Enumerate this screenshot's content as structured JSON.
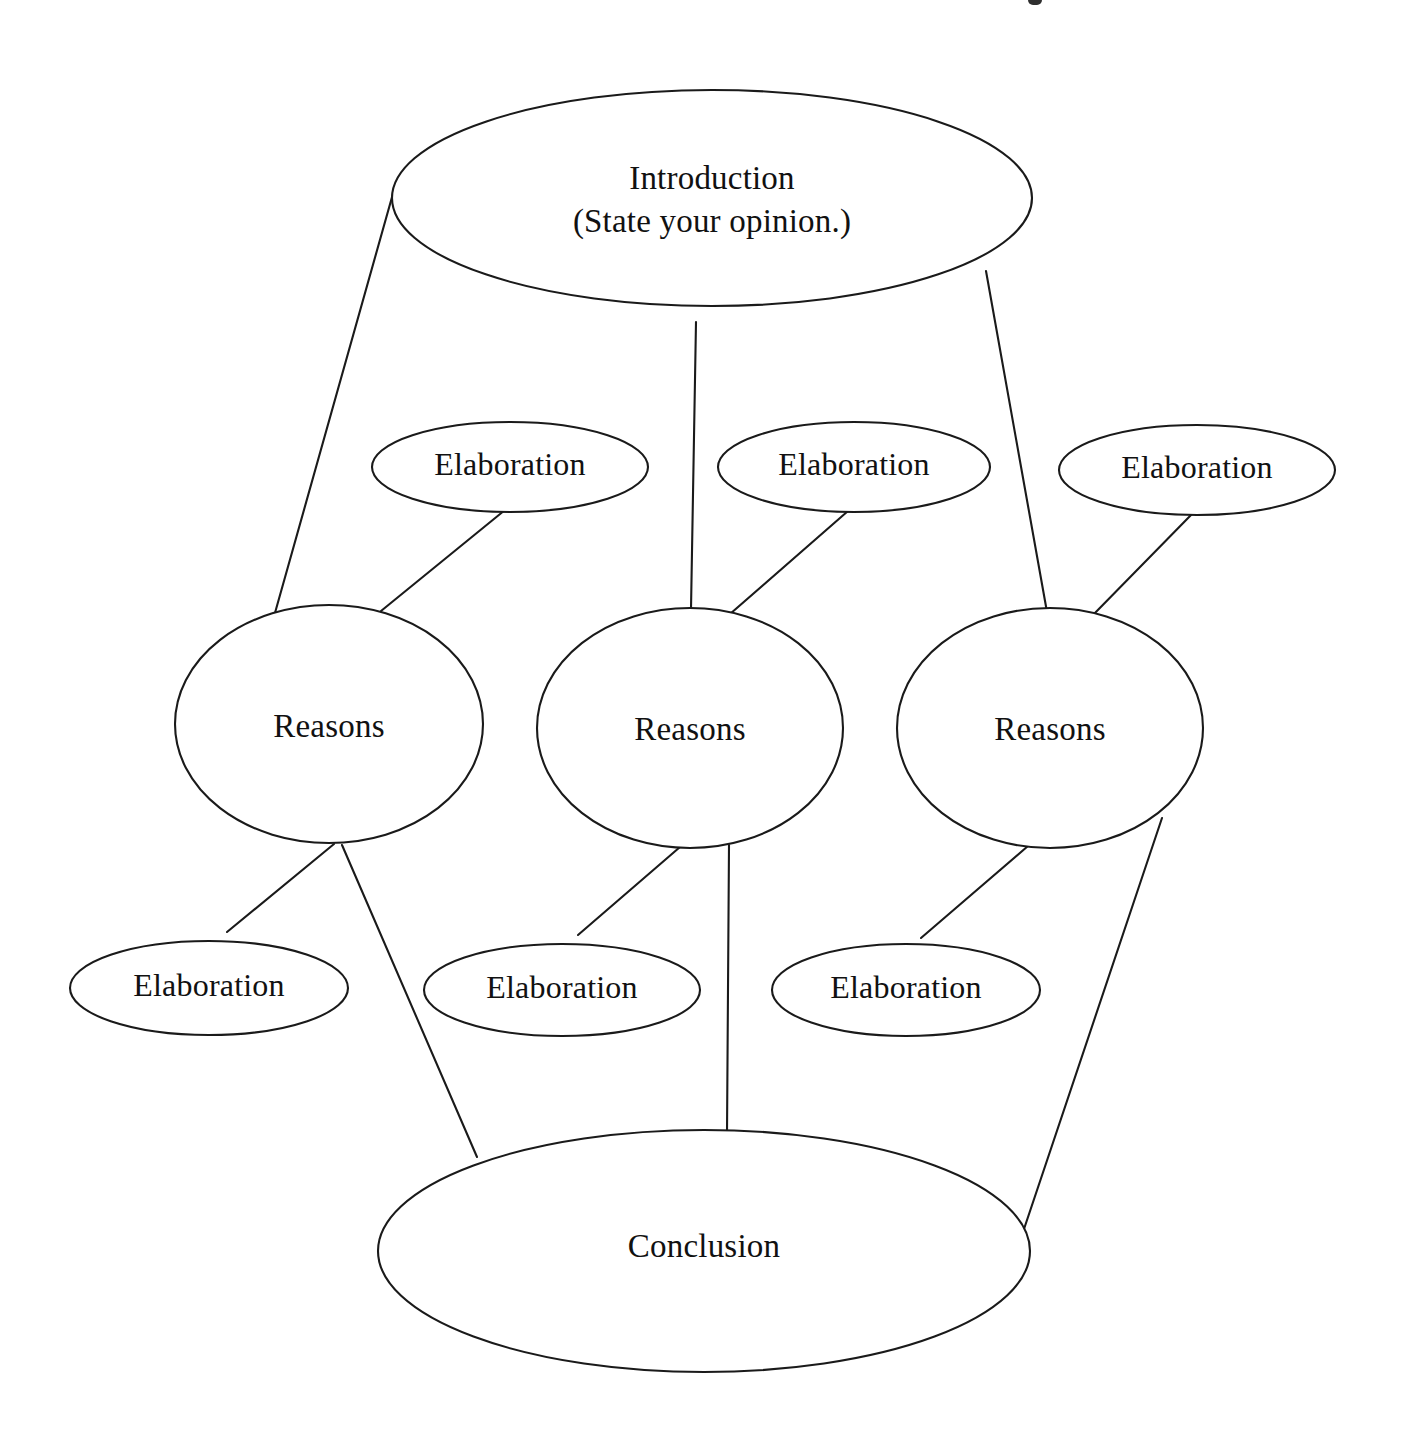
{
  "diagram": {
    "type": "opinion-essay-web",
    "background_color": "#ffffff",
    "line_color": "#1a1a1a",
    "text_color": "#111111",
    "nodes": {
      "introduction": {
        "label_line1": "Introduction",
        "label_line2": "(State your opinion.)",
        "shape": "ellipse"
      },
      "elaboration_top_1": {
        "label": "Elaboration",
        "shape": "ellipse"
      },
      "elaboration_top_2": {
        "label": "Elaboration",
        "shape": "ellipse"
      },
      "elaboration_top_3": {
        "label": "Elaboration",
        "shape": "ellipse"
      },
      "reasons_1": {
        "label": "Reasons",
        "shape": "ellipse"
      },
      "reasons_2": {
        "label": "Reasons",
        "shape": "ellipse"
      },
      "reasons_3": {
        "label": "Reasons",
        "shape": "ellipse"
      },
      "elaboration_bottom_1": {
        "label": "Elaboration",
        "shape": "ellipse"
      },
      "elaboration_bottom_2": {
        "label": "Elaboration",
        "shape": "ellipse"
      },
      "elaboration_bottom_3": {
        "label": "Elaboration",
        "shape": "ellipse"
      },
      "conclusion": {
        "label": "Conclusion",
        "shape": "ellipse"
      }
    },
    "edges": [
      {
        "from": "introduction",
        "to": "reasons_1"
      },
      {
        "from": "introduction",
        "to": "reasons_2"
      },
      {
        "from": "introduction",
        "to": "reasons_3"
      },
      {
        "from": "elaboration_top_1",
        "to": "reasons_1"
      },
      {
        "from": "elaboration_top_2",
        "to": "reasons_2"
      },
      {
        "from": "elaboration_top_3",
        "to": "reasons_3"
      },
      {
        "from": "reasons_1",
        "to": "elaboration_bottom_1"
      },
      {
        "from": "reasons_2",
        "to": "elaboration_bottom_2"
      },
      {
        "from": "reasons_3",
        "to": "elaboration_bottom_3"
      },
      {
        "from": "reasons_1",
        "to": "conclusion"
      },
      {
        "from": "reasons_2",
        "to": "conclusion"
      },
      {
        "from": "reasons_3",
        "to": "conclusion"
      }
    ]
  }
}
